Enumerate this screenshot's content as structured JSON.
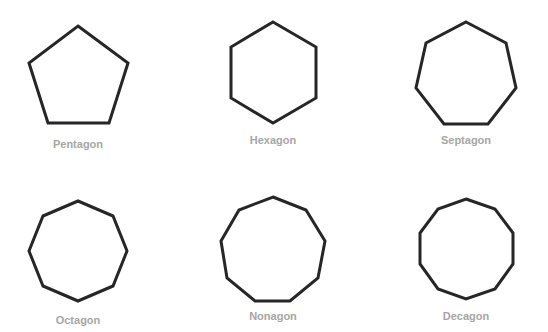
{
  "diagram": {
    "stroke_color": "#262626",
    "label_color": "#a6a6a6",
    "shapes": [
      {
        "name": "Pentagon",
        "sides": 5,
        "label": "Pentagon",
        "points": "78,26 128,63 109,123 48,123 29,63",
        "label_x": 78,
        "label_y": 138
      },
      {
        "name": "Hexagon",
        "sides": 6,
        "label": "Hexagon",
        "points": "273,22 316,47 316,98 273,123 231,98 231,47",
        "label_x": 273,
        "label_y": 134
      },
      {
        "name": "Septagon",
        "sides": 7,
        "label": "Septagon",
        "points": "466,22 506,43 516,88 488,124 444,124 416,88 426,43",
        "label_x": 466,
        "label_y": 134
      },
      {
        "name": "Octagon",
        "sides": 8,
        "label": "Octagon",
        "points": "78,201 113,216 127,251 113,286 78,301 43,286 29,251 43,216",
        "label_x": 78,
        "label_y": 314
      },
      {
        "name": "Nonagon",
        "sides": 9,
        "label": "Nonagon",
        "points": "273,197 306,210 325,241 318,278 290,301 255,301 227,278 221,241 239,210",
        "label_x": 273,
        "label_y": 310
      },
      {
        "name": "Decagon",
        "sides": 10,
        "label": "Decagon",
        "points": "466,199 495,209 513,233 513,264 495,289 466,299 438,289 420,264 420,233 438,209",
        "label_x": 466,
        "label_y": 310
      }
    ]
  }
}
